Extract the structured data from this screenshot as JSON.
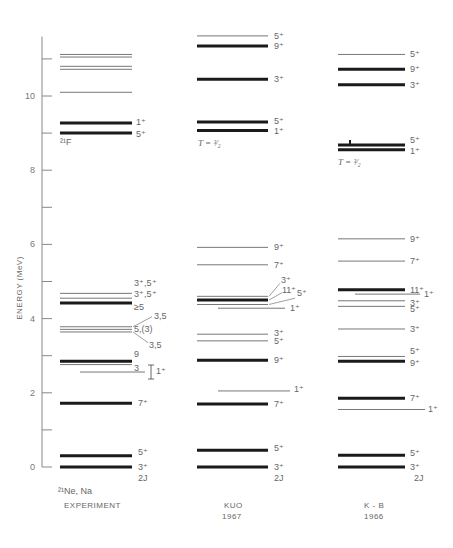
{
  "chart_data": {
    "type": "energy-level-diagram",
    "title": "",
    "ylabel": "ENERGY (MeV)",
    "ylim": [
      0,
      11.6
    ],
    "yticks": [
      0,
      2,
      4,
      6,
      8,
      10
    ],
    "yminor": [
      1,
      3,
      5,
      7,
      9,
      11
    ],
    "spin_label": "2J",
    "columns": [
      {
        "name": "EXPERIMENT",
        "nucleus_label": "21Ne, Na",
        "x0": 60,
        "x1": 132,
        "label_x": 138,
        "levels": [
          {
            "E": 0.0,
            "label": "3⁺",
            "w": 3
          },
          {
            "E": 0.3,
            "label": "5⁺",
            "w": 3
          },
          {
            "E": 1.72,
            "label": "7⁺",
            "w": 3
          },
          {
            "E": 2.56,
            "label": "1⁺",
            "w": 1,
            "x0": 80,
            "x1": 145,
            "bracket": true
          },
          {
            "E": 2.76,
            "label": "3",
            "w": 1.2
          },
          {
            "E": 2.85,
            "label": "9",
            "w": 3
          },
          {
            "E": 3.64,
            "label": "3,5",
            "w": 1,
            "leader": true
          },
          {
            "E": 3.71,
            "label": "5,(3)",
            "w": 1
          },
          {
            "E": 3.78,
            "label": "3,5",
            "w": 1,
            "leader": true
          },
          {
            "E": 4.42,
            "label": "≥5",
            "w": 3
          },
          {
            "E": 4.55,
            "label": "3⁺,5⁺",
            "w": 1
          },
          {
            "E": 4.68,
            "label": "3⁺,5⁺",
            "w": 1.2
          },
          {
            "E": 9.0,
            "label": "5⁺",
            "w": 3
          },
          {
            "E": 9.27,
            "label": "1⁺",
            "w": 3
          },
          {
            "E": 10.1,
            "label": "",
            "w": 1
          },
          {
            "E": 10.72,
            "label": "",
            "w": 1
          },
          {
            "E": 10.8,
            "label": "",
            "w": 1
          },
          {
            "E": 11.05,
            "label": "",
            "w": 1
          },
          {
            "E": 11.12,
            "label": "",
            "w": 1
          }
        ],
        "annotation": "21F"
      },
      {
        "name": "KUO",
        "year": "1967",
        "x0": 197,
        "x1": 268,
        "levels": [
          {
            "E": 0.0,
            "label": "3⁺",
            "w": 3
          },
          {
            "E": 0.45,
            "label": "5⁺",
            "w": 3
          },
          {
            "E": 1.7,
            "label": "7⁺",
            "w": 3
          },
          {
            "E": 2.05,
            "label": "1⁺",
            "w": 1,
            "x0": 218,
            "x1": 290
          },
          {
            "E": 2.88,
            "label": "9⁺",
            "w": 3
          },
          {
            "E": 3.4,
            "label": "5⁺",
            "w": 1
          },
          {
            "E": 3.58,
            "label": "3⁺",
            "w": 1
          },
          {
            "E": 4.28,
            "label": "1⁺",
            "w": 1,
            "x0": 218,
            "x1": 285
          },
          {
            "E": 4.38,
            "label": "5⁺",
            "w": 1
          },
          {
            "E": 4.5,
            "label": "11⁺",
            "w": 3
          },
          {
            "E": 4.6,
            "label": "3⁺",
            "w": 1
          },
          {
            "E": 5.45,
            "label": "7⁺",
            "w": 1
          },
          {
            "E": 5.92,
            "label": "9⁺",
            "w": 1
          },
          {
            "E": 9.07,
            "label": "1⁺",
            "w": 3
          },
          {
            "E": 9.3,
            "label": "5⁺",
            "w": 3
          },
          {
            "E": 10.45,
            "label": "3⁺",
            "w": 3
          },
          {
            "E": 11.35,
            "label": "9⁺",
            "w": 3
          },
          {
            "E": 11.62,
            "label": "5⁺",
            "w": 1
          }
        ],
        "annotation": "T=3/2"
      },
      {
        "name": "K-B",
        "year": "1966",
        "x0": 338,
        "x1": 405,
        "levels": [
          {
            "E": 0.0,
            "label": "3⁺",
            "w": 3
          },
          {
            "E": 0.32,
            "label": "5⁺",
            "w": 3
          },
          {
            "E": 1.55,
            "label": "1⁺",
            "w": 1,
            "x0": 338,
            "x1": 425
          },
          {
            "E": 1.85,
            "label": "7⁺",
            "w": 3
          },
          {
            "E": 2.85,
            "label": "9⁺",
            "w": 3
          },
          {
            "E": 2.98,
            "label": "5⁺",
            "w": 1
          },
          {
            "E": 3.72,
            "label": "3⁺",
            "w": 1
          },
          {
            "E": 4.33,
            "label": "5⁺",
            "w": 1
          },
          {
            "E": 4.48,
            "label": "3⁺",
            "w": 1
          },
          {
            "E": 4.66,
            "label": "1⁺",
            "w": 1,
            "x0": 355,
            "x1": 420
          },
          {
            "E": 4.78,
            "label": "11⁺",
            "w": 3
          },
          {
            "E": 5.55,
            "label": "7⁺",
            "w": 1
          },
          {
            "E": 6.15,
            "label": "9⁺",
            "w": 1
          },
          {
            "E": 8.55,
            "label": "1⁺",
            "w": 3
          },
          {
            "E": 8.68,
            "label": "5⁺",
            "w": 3
          },
          {
            "E": 10.3,
            "label": "3⁺",
            "w": 3
          },
          {
            "E": 10.72,
            "label": "9⁺",
            "w": 3
          },
          {
            "E": 11.12,
            "label": "5⁺",
            "w": 1
          }
        ],
        "annotation": "T=3/2"
      }
    ]
  },
  "axis": {
    "label": "ENERGY (MeV)",
    "ticks": [
      "0",
      "2",
      "4",
      "6",
      "8",
      "10"
    ]
  },
  "columns": {
    "experiment": {
      "nucleus": "²¹Ne, Na",
      "title": "EXPERIMENT",
      "spin": "2J",
      "note": "²¹F"
    },
    "kuo": {
      "title": "KUO",
      "year": "1967",
      "spin": "2J",
      "note": "T = ³⁄₂"
    },
    "kb": {
      "title": "K - B",
      "year": "1966",
      "spin": "2J",
      "note": "T = ³⁄₂"
    }
  }
}
